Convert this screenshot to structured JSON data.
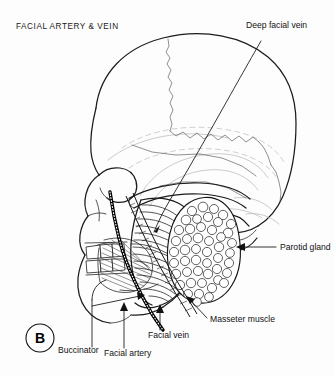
{
  "figure": {
    "title": "FACIAL ARTERY & VEIN",
    "panel_marker": "B",
    "background_color": "#fdfdfd",
    "ink_color": "#1c1c1c",
    "width": 334,
    "height": 377
  },
  "labels": {
    "deep_facial_vein": "Deep facial vein",
    "parotid_gland": "Parotid gland",
    "masseter_muscle": "Masseter muscle",
    "facial_vein": "Facial vein",
    "facial_artery": "Facial artery",
    "buccinator": "Buccinator"
  },
  "structures": [
    {
      "name": "cranium",
      "kind": "bone"
    },
    {
      "name": "coronal-suture",
      "kind": "suture"
    },
    {
      "name": "zygomatic-arch",
      "kind": "bone"
    },
    {
      "name": "mandible",
      "kind": "bone"
    },
    {
      "name": "maxilla",
      "kind": "bone"
    },
    {
      "name": "teeth",
      "kind": "bone"
    },
    {
      "name": "external-acoustic-meatus",
      "kind": "bone"
    },
    {
      "name": "masseter-muscle",
      "kind": "muscle"
    },
    {
      "name": "buccinator-muscle",
      "kind": "muscle"
    },
    {
      "name": "parotid-gland",
      "kind": "gland"
    },
    {
      "name": "facial-artery",
      "kind": "artery"
    },
    {
      "name": "facial-vein",
      "kind": "vein"
    },
    {
      "name": "deep-facial-vein",
      "kind": "vein"
    }
  ]
}
